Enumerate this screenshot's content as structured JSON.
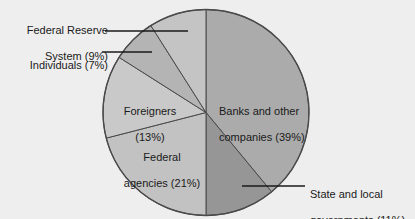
{
  "chart_data": {
    "type": "pie",
    "title": "",
    "subtitle": "",
    "xlabel": "",
    "ylabel": "",
    "legend_position": "none",
    "grid": false,
    "total_percent": 100,
    "slices": [
      {
        "name": "banks-and-other-companies",
        "label": "Banks and other\ncompanies (39%)",
        "label_line1": "Banks and other",
        "label_line2": "companies (39%)",
        "value": 39,
        "color": "#ababab",
        "label_placement": "inside"
      },
      {
        "name": "state-and-local-governments",
        "label": "State and local\ngovernments (11%)",
        "label_line1": "State and local",
        "label_line2": "governments (11%)",
        "value": 11,
        "color": "#969696",
        "label_placement": "callout-right"
      },
      {
        "name": "federal-agencies",
        "label": "Federal\nagencies (21%)",
        "label_line1": "Federal",
        "label_line2": "agencies (21%)",
        "value": 21,
        "color": "#c2c2c2",
        "label_placement": "inside"
      },
      {
        "name": "foreigners",
        "label": "Foreigners\n(13%)",
        "label_line1": "Foreigners",
        "label_line2": "(13%)",
        "value": 13,
        "color": "#c9c9c9",
        "label_placement": "inside"
      },
      {
        "name": "individuals",
        "label": "Individuals (7%)",
        "label_line1": "Individuals (7%)",
        "label_line2": "",
        "value": 7,
        "color": "#b4b4b4",
        "label_placement": "callout-left"
      },
      {
        "name": "federal-reserve-system",
        "label": "Federal Reserve\nSystem (9%)",
        "label_line1": "Federal Reserve",
        "label_line2": "System (9%)",
        "value": 9,
        "color": "#c4c4c4",
        "label_placement": "callout-left"
      }
    ],
    "colors": {
      "background": "#eeeeee",
      "outline": "#4a4a4a",
      "text": "#1a1a1a",
      "leader_line": "#1a1a1a"
    }
  }
}
